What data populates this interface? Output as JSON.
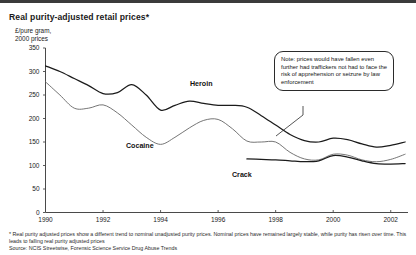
{
  "chart_title": "Real purity-adjusted retail prices*",
  "y_axis_caption": "£/pure gram,\n2000 prices",
  "note": {
    "text": "Note: prices would have fallen even further had traffickers not had to face the risk of apprehension or seizure by law enforcement"
  },
  "footnote": {
    "line1": "* Real purity adjusted prices show  a different trend to nominal unadjusted purity prices. Nominal prices have remained largely stable, while purity has risen over time. This leads to falling real purity adjusted prices",
    "source": "Source: NCIS Streetwise, Forensic Science Service Drug Abuse Trends"
  },
  "series_labels": {
    "heroin": "Heroin",
    "cocaine": "Cocaine",
    "crack": "Crack"
  },
  "chart_data": {
    "type": "line",
    "title": "Real purity-adjusted retail prices*",
    "xlabel": "",
    "ylabel": "£/pure gram, 2000 prices",
    "xlim": [
      1990,
      2002.6
    ],
    "ylim": [
      0,
      350
    ],
    "yticks": [
      0,
      50,
      100,
      150,
      200,
      250,
      300,
      350
    ],
    "ytick_labels": [
      "0",
      "50",
      "100",
      "150",
      "200",
      "250",
      "300",
      "350"
    ],
    "xticks": [
      1990,
      1992,
      1994,
      1996,
      1998,
      2000,
      2002
    ],
    "xtick_labels": [
      "1990",
      "1992",
      "1994",
      "1996",
      "1998",
      "2000",
      "2002"
    ],
    "grid": false,
    "legend": "inline-annotations",
    "series": [
      {
        "name": "Heroin",
        "color": "#1b1b1b",
        "x": [
          1990,
          1990.5,
          1991,
          1991.5,
          1992,
          1992.5,
          1993,
          1993.5,
          1994,
          1994.5,
          1995,
          1995.5,
          1996,
          1996.5,
          1997,
          1997.5,
          1998,
          1998.5,
          1999,
          1999.5,
          2000,
          2000.5,
          2001,
          2001.5,
          2002,
          2002.5
        ],
        "y": [
          312,
          300,
          285,
          270,
          253,
          255,
          272,
          250,
          218,
          228,
          237,
          232,
          228,
          228,
          224,
          206,
          186,
          166,
          153,
          150,
          158,
          155,
          146,
          139,
          143,
          150
        ]
      },
      {
        "name": "Cocaine",
        "color": "#6e6e6e",
        "x": [
          1990,
          1990.5,
          1991,
          1991.5,
          1992,
          1992.5,
          1993,
          1993.5,
          1994,
          1994.5,
          1995,
          1995.5,
          1996,
          1996.5,
          1997,
          1997.5,
          1998,
          1998.5,
          1999,
          1999.5,
          2000,
          2000.5,
          2001,
          2001.5,
          2002,
          2002.5
        ],
        "y": [
          278,
          250,
          222,
          222,
          229,
          212,
          186,
          160,
          145,
          160,
          180,
          196,
          198,
          178,
          152,
          150,
          150,
          128,
          114,
          112,
          124,
          122,
          112,
          108,
          113,
          124
        ]
      },
      {
        "name": "Crack",
        "color": "#1b1b1b",
        "x": [
          1997,
          1997.5,
          1998,
          1998.5,
          1999,
          1999.5,
          2000,
          2000.5,
          2001,
          2001.5,
          2002,
          2002.5
        ],
        "y": [
          114,
          113,
          112,
          110,
          108,
          110,
          121,
          118,
          110,
          104,
          103,
          104
        ]
      }
    ],
    "annotation": {
      "text": "Note: prices would have fallen even further had traffickers not had to face the risk of apprehension or seizure by law enforcement",
      "points_to": {
        "x": 1999.0,
        "y": 155
      }
    }
  }
}
